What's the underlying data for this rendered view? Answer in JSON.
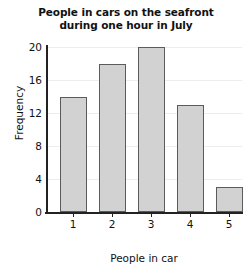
{
  "chart_data": {
    "type": "bar",
    "title": "People in cars on the seafront during one hour in July",
    "title_line1": "People in cars on the seafront",
    "title_line2": "during one hour in July",
    "xlabel": "People in car",
    "ylabel": "Frequency",
    "categories": [
      "1",
      "2",
      "3",
      "4",
      "5"
    ],
    "values": [
      14,
      18,
      20,
      13,
      3
    ],
    "ylim": [
      0,
      20
    ],
    "yticks": [
      "0",
      "4",
      "8",
      "12",
      "16",
      "20"
    ],
    "ytick_values": [
      0,
      4,
      8,
      12,
      16,
      20
    ],
    "grid": true,
    "legend": false,
    "bar_fill_color": "#d2d2d2",
    "bar_edge_color": "#5b5b5b",
    "axis_color": "#222222",
    "grid_color": "#ededed",
    "background_color": "#ffffff"
  }
}
